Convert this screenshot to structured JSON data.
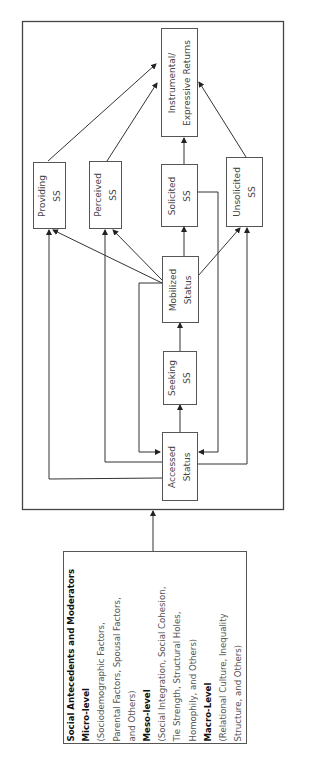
{
  "diagram": {
    "outer_frame": {
      "label": "Social support process"
    },
    "nodes": {
      "instrumental": {
        "line1": "Instrumental/",
        "line2": "Expressive Returns"
      },
      "providing": {
        "line1": "Providing",
        "line2": "SS"
      },
      "perceived": {
        "line1": "Perceived",
        "line2": "SS"
      },
      "solicited": {
        "line1": "Solicited",
        "line2": "SS"
      },
      "unsolicited": {
        "line1": "Unsolicited",
        "line2": "SS"
      },
      "mobilized": {
        "line1": "Mobilized",
        "line2": "Status"
      },
      "seeking": {
        "line1": "Seeking",
        "line2": "SS"
      },
      "accessed": {
        "line1": "Accessed",
        "line2": "Status"
      }
    },
    "antecedents": {
      "title": "Social Antecedents and Moderators",
      "micro_heading": "Micro-level",
      "micro_lines": [
        "(Sociodemographic Factors,",
        "Parental Factors, Spousal Factors,",
        "and Others)"
      ],
      "meso_heading": "Meso-level",
      "meso_lines": [
        "(Social Integration, Social Cohesion,",
        "Tie Strength, Structural Holes,",
        "Homophily, and Others)"
      ],
      "macro_heading": "Macro-Level",
      "macro_lines": [
        "(Relational Culture, Inequality",
        "Structure, and Others)"
      ]
    },
    "edges": [
      {
        "from": "antecedents",
        "to": "outer_frame"
      },
      {
        "from": "accessed",
        "to": "seeking"
      },
      {
        "from": "seeking",
        "to": "mobilized"
      },
      {
        "from": "mobilized",
        "to": "solicited"
      },
      {
        "from": "mobilized",
        "to": "providing"
      },
      {
        "from": "mobilized",
        "to": "perceived"
      },
      {
        "from": "mobilized",
        "to": "unsolicited"
      },
      {
        "from": "mobilized",
        "to": "accessed"
      },
      {
        "from": "solicited",
        "to": "accessed"
      },
      {
        "from": "accessed",
        "to": "providing"
      },
      {
        "from": "accessed",
        "to": "perceived"
      },
      {
        "from": "accessed",
        "to": "unsolicited"
      },
      {
        "from": "providing",
        "to": "instrumental"
      },
      {
        "from": "perceived",
        "to": "instrumental"
      },
      {
        "from": "solicited",
        "to": "instrumental"
      },
      {
        "from": "unsolicited",
        "to": "instrumental"
      }
    ],
    "colors": {
      "line": "#333333",
      "box_border": "#555555",
      "text": "#444444"
    }
  }
}
